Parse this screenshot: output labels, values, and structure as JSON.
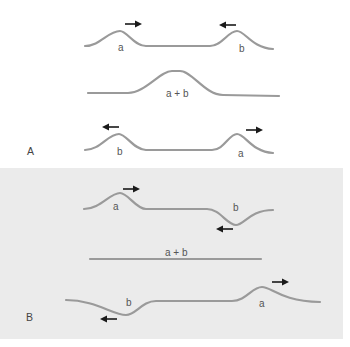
{
  "figure": {
    "colors": {
      "wave": "#9a9a9a",
      "arrow": "#1a1a1a",
      "panel_a_bg": "#ffffff",
      "panel_b_bg": "#ebebeb",
      "label": "#555555"
    }
  },
  "panel_a": {
    "label": "A",
    "row1": {
      "pulse_left_label": "a",
      "pulse_left_direction": "right",
      "pulse_right_label": "b",
      "pulse_right_direction": "left"
    },
    "row2": {
      "sum_label": "a + b"
    },
    "row3": {
      "pulse_left_label": "b",
      "pulse_left_direction": "left",
      "pulse_right_label": "a",
      "pulse_right_direction": "right"
    }
  },
  "panel_b": {
    "label": "B",
    "row1": {
      "pulse_left_label": "a",
      "pulse_left_direction": "right",
      "pulse_right_label": "b",
      "pulse_right_direction": "left"
    },
    "row2": {
      "sum_label": "a + b"
    },
    "row3": {
      "pulse_left_label": "b",
      "pulse_left_direction": "left",
      "pulse_right_label": "a",
      "pulse_right_direction": "right"
    }
  },
  "icons": {
    "right_arrow": "arrow-right-icon",
    "left_arrow": "arrow-left-icon"
  }
}
